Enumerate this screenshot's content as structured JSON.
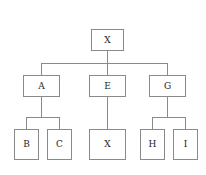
{
  "diagram": {
    "type": "tree",
    "title": "",
    "node_labels": {
      "root": "X",
      "a": "A",
      "e": "E",
      "g": "G",
      "b": "B",
      "c": "C",
      "x_leaf": "X",
      "h": "H",
      "i": "I"
    },
    "colors": {
      "background": "#ffffff",
      "border": "#8a8a8a",
      "edge": "#8a8a8a",
      "text": "#1c1c1c"
    },
    "levels": [
      {
        "depth": 0,
        "nodes": [
          "X"
        ]
      },
      {
        "depth": 1,
        "nodes": [
          "A",
          "E",
          "G"
        ]
      },
      {
        "depth": 2,
        "nodes": [
          "B",
          "C",
          "X",
          "H",
          "I"
        ]
      }
    ],
    "edges": [
      {
        "from": "X",
        "to": "A"
      },
      {
        "from": "X",
        "to": "E"
      },
      {
        "from": "X",
        "to": "G"
      },
      {
        "from": "A",
        "to": "B"
      },
      {
        "from": "A",
        "to": "C"
      },
      {
        "from": "E",
        "to": "X"
      },
      {
        "from": "G",
        "to": "H"
      },
      {
        "from": "G",
        "to": "I"
      }
    ]
  }
}
